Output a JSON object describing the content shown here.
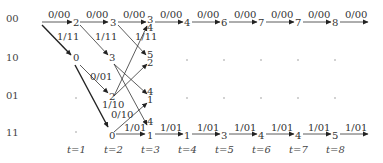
{
  "diagram": {
    "type": "trellis",
    "states": [
      "00",
      "10",
      "01",
      "11"
    ],
    "time_labels": [
      "t=1",
      "t=2",
      "t=3",
      "t=4",
      "t=5",
      "t=6",
      "t=7",
      "t=8"
    ],
    "edge_labels": {
      "row00": [
        "0/00",
        "0/00",
        "0/00",
        "0/00",
        "0/00",
        "0/00",
        "0/00",
        "0/00",
        "0/00"
      ],
      "diag_00_10": [
        "1/11",
        "1/11",
        "1/11"
      ],
      "diag_10_01": "0/01",
      "diag_01_11": "1/10",
      "diag_11_01": "0/10",
      "row11": [
        "1/01",
        "1/01",
        "1/01",
        "1/01",
        "1/01",
        "1/01",
        "1/01"
      ]
    },
    "metrics": {
      "row00": [
        "2",
        "3",
        "3",
        "4",
        "4",
        "6",
        "7",
        "7",
        "8"
      ],
      "row10": [
        "0",
        "3",
        "5",
        "2"
      ],
      "row01": [
        "2",
        "4",
        "1"
      ],
      "row11": [
        "0",
        "4",
        "1",
        "1",
        "3",
        "4",
        "4",
        "5"
      ]
    }
  }
}
